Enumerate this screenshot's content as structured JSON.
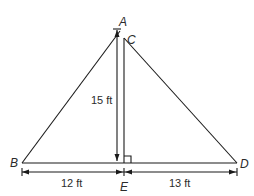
{
  "diagram": {
    "type": "geometry-figure",
    "points": {
      "A": {
        "label": "A",
        "x": 123,
        "y": 31
      },
      "C": {
        "label": "C",
        "x": 123,
        "y": 37
      },
      "B": {
        "label": "B",
        "x": 22,
        "y": 163
      },
      "D": {
        "label": "D",
        "x": 237,
        "y": 163
      },
      "E": {
        "label": "E",
        "x": 123,
        "y": 163
      }
    },
    "segments": [
      {
        "from": "B",
        "to": "A"
      },
      {
        "from": "C",
        "to": "D"
      },
      {
        "from": "C",
        "to": "E"
      },
      {
        "from": "B",
        "to": "D"
      }
    ],
    "measurements": {
      "height": {
        "label": "15 ft",
        "segment": "AE"
      },
      "left_base": {
        "label": "12 ft",
        "segment": "BE"
      },
      "right_base": {
        "label": "13 ft",
        "segment": "ED"
      }
    },
    "right_angle_marker": {
      "at": "E",
      "between": [
        "CE",
        "ED"
      ]
    },
    "colors": {
      "stroke": "#1a1a1a",
      "text": "#2b2b2b",
      "background": "#ffffff"
    }
  }
}
